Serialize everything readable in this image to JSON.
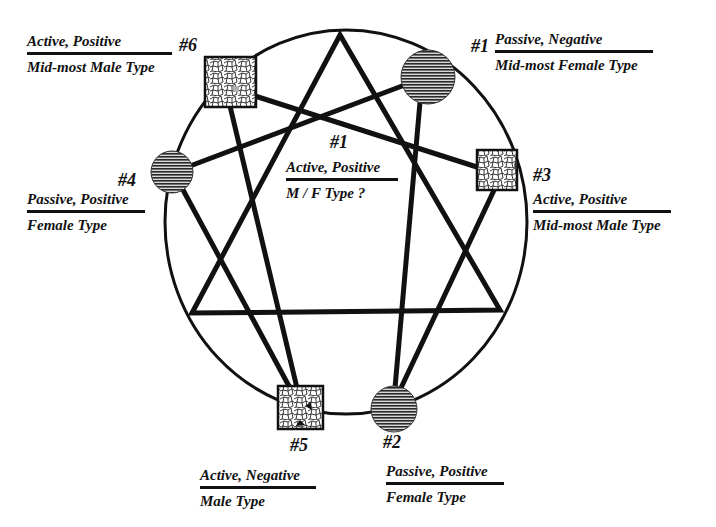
{
  "diagram": {
    "type": "enneagram-style figure",
    "colors": {
      "ink": "#111111",
      "background": "#ffffff",
      "circle_fill": "#8a8a8a",
      "square_fill": "#ffffff",
      "cell_highlight": "#b0b0b0"
    },
    "nodes": [
      {
        "id": "n6",
        "number": "#6",
        "shape": "square",
        "pattern": "cellular",
        "line1": "Active, Positive",
        "line2": "Mid-most Male Type"
      },
      {
        "id": "n1_outer",
        "number": "#1",
        "shape": "circle",
        "pattern": "hatched",
        "line1": "Passive, Negative",
        "line2": "Mid-most Female Type"
      },
      {
        "id": "n4",
        "number": "#4",
        "shape": "circle",
        "pattern": "hatched",
        "line1": "Passive, Positive",
        "line2": "Female Type"
      },
      {
        "id": "n3",
        "number": "#3",
        "shape": "square",
        "pattern": "cellular",
        "line1": "Active, Positive",
        "line2": "Mid-most Male Type"
      },
      {
        "id": "n5",
        "number": "#5",
        "shape": "square",
        "pattern": "cellular",
        "line1": "Active, Negative",
        "line2": "Male Type"
      },
      {
        "id": "n2",
        "number": "#2",
        "shape": "circle",
        "pattern": "hatched",
        "line1": "Passive, Positive",
        "line2": "Female Type"
      }
    ],
    "center": {
      "number": "#1",
      "line1": "Active, Positive",
      "line2": "M / F Type ?"
    },
    "edges": [
      [
        "n6",
        "n3"
      ],
      [
        "n6",
        "n5"
      ],
      [
        "n4",
        "n1_outer"
      ],
      [
        "n4",
        "n5"
      ],
      [
        "n1_outer",
        "n2"
      ],
      [
        "n3",
        "n2"
      ]
    ],
    "triangle": [
      "apex-top",
      "bottom-left",
      "bottom-right"
    ]
  }
}
